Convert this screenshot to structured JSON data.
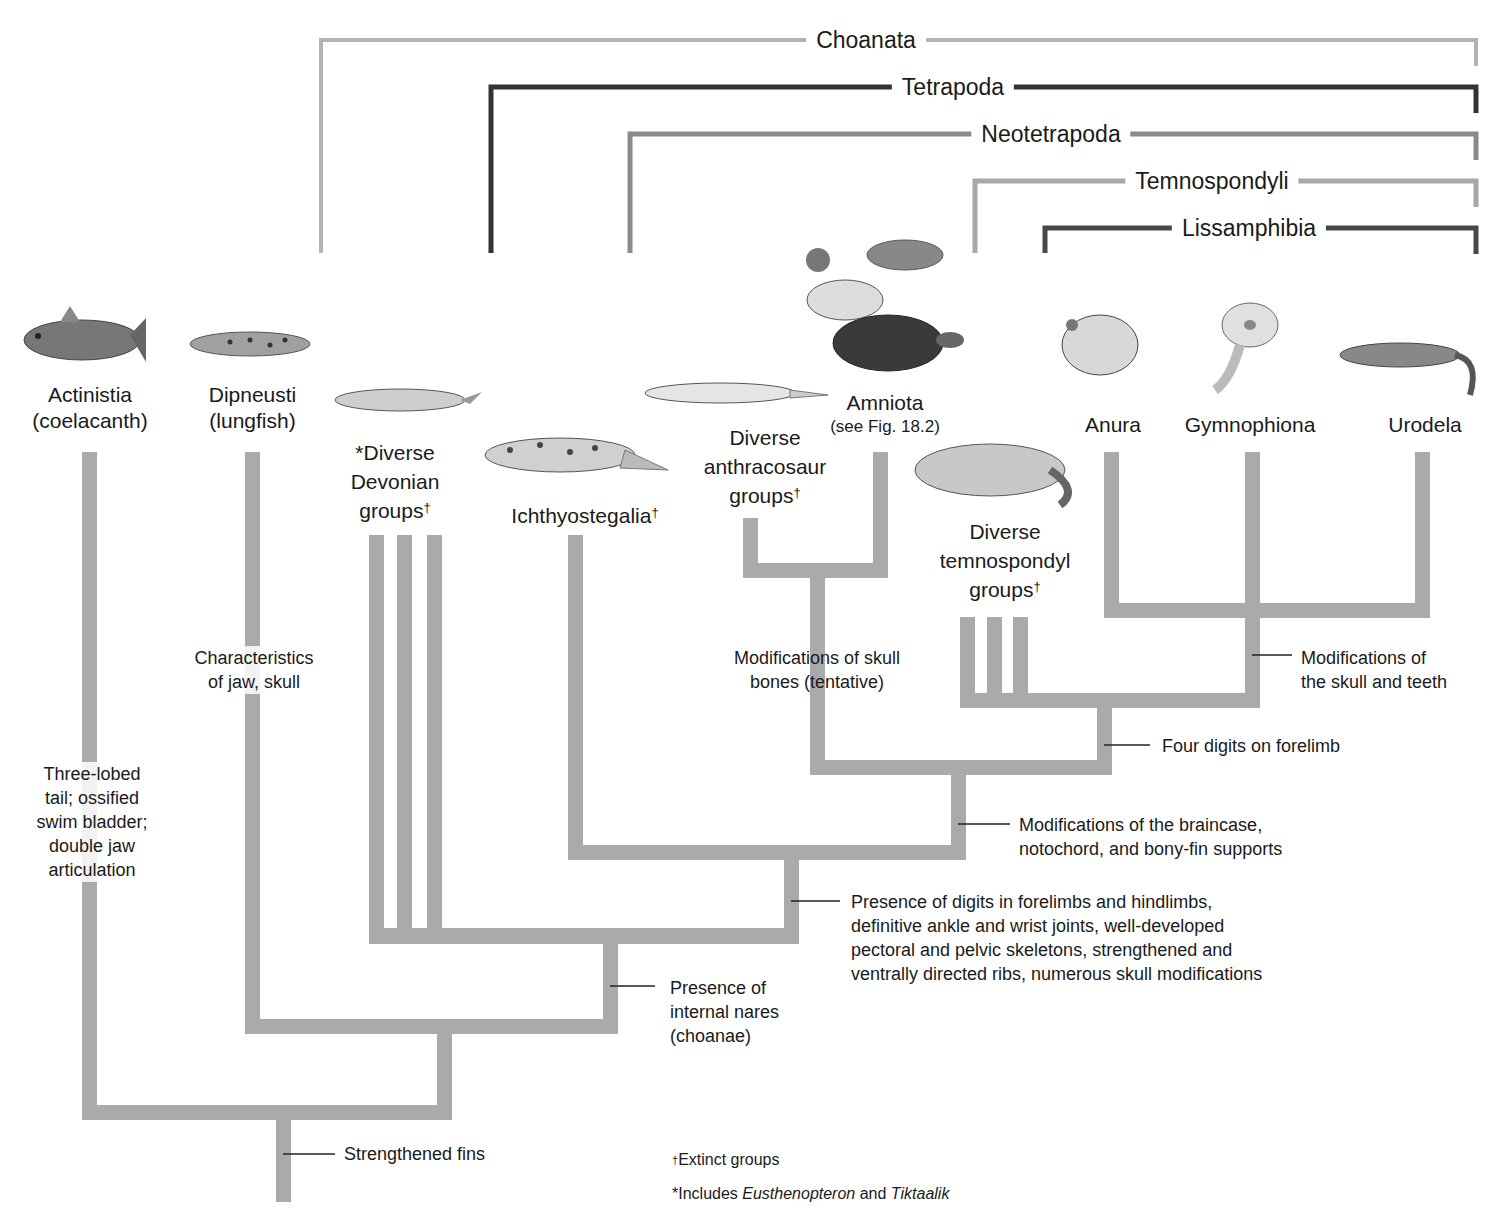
{
  "colors": {
    "branch": "#aaaaaa",
    "choanata": "#b3b3b3",
    "tetrapoda": "#333333",
    "neotetrapoda": "#8a8a8a",
    "temnospondyli": "#a8a8a8",
    "lissamphibia": "#484848",
    "text": "#1a1a1a"
  },
  "clades": [
    {
      "id": "choanata",
      "label": "Choanata"
    },
    {
      "id": "tetrapoda",
      "label": "Tetrapoda"
    },
    {
      "id": "neotetrapoda",
      "label": "Neotetrapoda"
    },
    {
      "id": "temnospondyli",
      "label": "Temnospondyli"
    },
    {
      "id": "lissamphibia",
      "label": "Lissamphibia"
    }
  ],
  "taxa": {
    "actinistia": {
      "name": "Actinistia",
      "common": "(coelacanth)",
      "icon": "coelacanth-illustration"
    },
    "dipneusti": {
      "name": "Dipneusti",
      "common": "(lungfish)",
      "icon": "lungfish-illustration"
    },
    "devonian": {
      "line1": "*Diverse",
      "line2": "Devonian",
      "line3": "groups",
      "dagger": "†",
      "icon": "devonian-fish-illustration"
    },
    "ichthyostegalia": {
      "name": "Ichthyostegalia",
      "dagger": "†",
      "icon": "ichthyostega-illustration"
    },
    "anthracosaur": {
      "line1": "Diverse",
      "line2": "anthracosaur",
      "line3": "groups",
      "dagger": "†",
      "icon": "anthracosaur-illustration"
    },
    "amniota": {
      "name": "Amniota",
      "ref": "(see Fig. 18.2)",
      "icon": "duck-shrew-turtle-illustration"
    },
    "temnospondyl": {
      "line1": "Diverse",
      "line2": "temnospondyl",
      "line3": "groups",
      "dagger": "†",
      "icon": "temnospondyl-illustration"
    },
    "anura": {
      "name": "Anura",
      "icon": "frog-illustration"
    },
    "gymnophiona": {
      "name": "Gymnophiona",
      "icon": "caecilian-illustration"
    },
    "urodela": {
      "name": "Urodela",
      "icon": "salamander-illustration"
    }
  },
  "characters": {
    "three_lobed": {
      "l1": "Three-lobed",
      "l2": "tail; ossified",
      "l3": "swim bladder;",
      "l4": "double jaw",
      "l5": "articulation"
    },
    "jaw_skull": {
      "l1": "Characteristics",
      "l2": "of jaw, skull"
    },
    "skull_bones": {
      "l1": "Modifications of skull",
      "l2": "bones (tentative)"
    },
    "skull_teeth": {
      "l1": "Modifications of",
      "l2": "the skull and teeth"
    },
    "four_digits": {
      "l1": "Four digits on forelimb"
    },
    "braincase": {
      "l1": "Modifications of the braincase,",
      "l2": "notochord, and bony-fin supports"
    },
    "digits": {
      "l1": "Presence of digits in forelimbs and hindlimbs,",
      "l2": "definitive ankle and wrist joints, well-developed",
      "l3": "pectoral and pelvic skeletons, strengthened and",
      "l4": "ventrally directed ribs, numerous skull modifications"
    },
    "nares": {
      "l1": "Presence of",
      "l2": "internal nares",
      "l3": "(choanae)"
    },
    "fins": {
      "l1": "Strengthened fins"
    }
  },
  "footnotes": {
    "extinct_mark": "†",
    "extinct_text": "Extinct groups",
    "includes_prefix": "*Includes ",
    "genus1": "Eusthenopteron",
    "and": " and ",
    "genus2": "Tiktaalik"
  }
}
